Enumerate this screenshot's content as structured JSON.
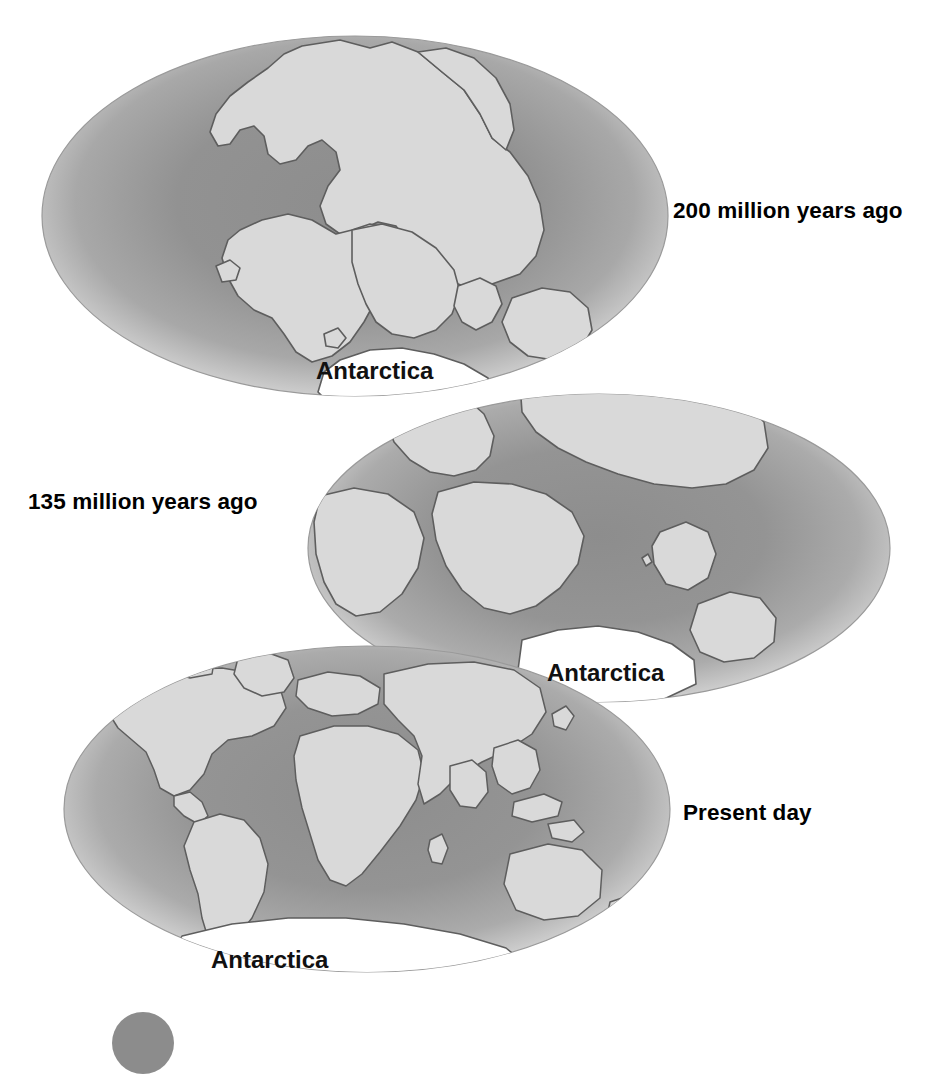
{
  "figure": {
    "background_color": "#ffffff"
  },
  "palette": {
    "land": "#d9d9d9",
    "ocean_mid": "#8a8a8a",
    "ocean_light": "#c9c9c9",
    "ocean_rim_highlight": "#e4e4e4",
    "outline": "#5a5a5a",
    "antarctica": "#ffffff",
    "text": "#111111",
    "badge": "#8c8c8c"
  },
  "globes": [
    {
      "id": "globe-200ma",
      "time_label": "200 million years ago",
      "antarctica_label": "Antarctica",
      "stage": "Pangaea supercontinent"
    },
    {
      "id": "globe-135ma",
      "time_label": "135 million years ago",
      "antarctica_label": "Antarctica",
      "stage": "Laurasia and Gondwana separating"
    },
    {
      "id": "globe-present",
      "time_label": "Present day",
      "antarctica_label": "Antarctica",
      "stage": "Modern continents"
    }
  ],
  "labels": {
    "time_200": "200 million years ago",
    "time_135": "135 million years ago",
    "time_present": "Present day",
    "antarctica": "Antarctica"
  }
}
